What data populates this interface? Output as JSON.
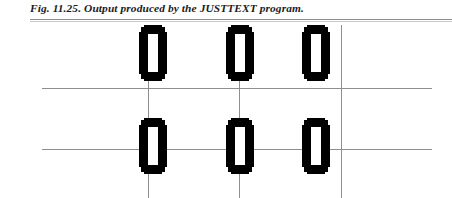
{
  "page": {
    "width": 452,
    "height": 198,
    "background": "#ffffff"
  },
  "caption": {
    "figure_label": "Fig. 11.25.",
    "figure_text": " Output produced by the JUSTTEXT program.",
    "full_text": "Fig. 11.25. Output produced by the JUSTTEXT program.",
    "color": "#1b1b1b"
  },
  "figure": {
    "ink_color": "#000000",
    "guide_color": "#8e8e8e",
    "rows": [
      {
        "name": "top-row",
        "top": 5,
        "glyphs": [
          {
            "char": "0",
            "left": 140
          },
          {
            "char": "0",
            "left": 227
          },
          {
            "char": "0",
            "left": 303
          }
        ]
      },
      {
        "name": "bottom-row",
        "top": 98,
        "glyphs": [
          {
            "char": "0",
            "left": 140
          },
          {
            "char": "0",
            "left": 227
          },
          {
            "char": "0",
            "left": 303
          }
        ]
      }
    ],
    "vertical_guides": [
      {
        "name": "left-guide",
        "x": 148
      },
      {
        "name": "center-guide",
        "x": 239
      },
      {
        "name": "right-guide",
        "x": 341
      }
    ],
    "horizontal_guides": [
      {
        "name": "upper-baseline",
        "y": 66
      },
      {
        "name": "lower-baseline",
        "y": 127
      }
    ]
  }
}
